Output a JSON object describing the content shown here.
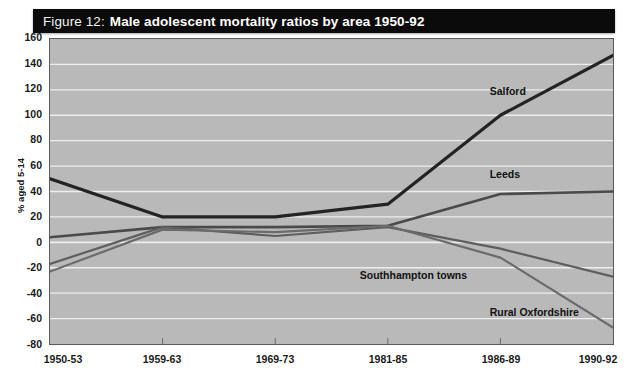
{
  "figure": {
    "title_prefix": "Figure 12:",
    "title_main": "Male adolescent mortality ratios by area 1950-92",
    "banner_color": "#0b0b0b",
    "plot_background": "#b9b9b9",
    "gridline_color": "#eeeeee",
    "frame_color": "#5a5a5a"
  },
  "chart_data": {
    "type": "line",
    "title": "Figure 12: Male adolescent mortality ratios by area 1950-92",
    "xlabel": "",
    "ylabel": "% aged 5-14",
    "categories": [
      "1950-53",
      "1959-63",
      "1969-73",
      "1981-85",
      "1986-89",
      "1990-92"
    ],
    "ylim": [
      -80,
      160
    ],
    "ytick_step": 20,
    "yticks": [
      160,
      140,
      120,
      100,
      80,
      60,
      40,
      20,
      0,
      -20,
      -40,
      -60,
      -80
    ],
    "ytick_labels": [
      "160",
      "140",
      "120",
      "100",
      "80",
      "60",
      "40",
      "20",
      "0",
      "-20",
      "-40",
      "-60",
      "-80"
    ],
    "grid": true,
    "legend": "inline-labels",
    "series": [
      {
        "name": "Salford",
        "color": "#232323",
        "width": 3.2,
        "values": [
          50,
          20,
          20,
          30,
          100,
          147
        ],
        "label_x_pct": 78,
        "label_y_value": 118
      },
      {
        "name": "Leeds",
        "color": "#4a4a4a",
        "width": 2.6,
        "values": [
          4,
          12,
          12,
          13,
          38,
          40
        ],
        "label_x_pct": 78,
        "label_y_value": 53
      },
      {
        "name": "Southhampton towns",
        "color": "#5e5e5e",
        "width": 2.2,
        "values": [
          -17,
          12,
          5,
          12,
          -5,
          -27
        ],
        "label_x_pct": 55,
        "label_y_value": -26
      },
      {
        "name": "Rural Oxfordshire",
        "color": "#6b6b6b",
        "width": 2.2,
        "values": [
          -23,
          10,
          8,
          13,
          -12,
          -67
        ],
        "label_x_pct": 78,
        "label_y_value": -55
      }
    ]
  }
}
